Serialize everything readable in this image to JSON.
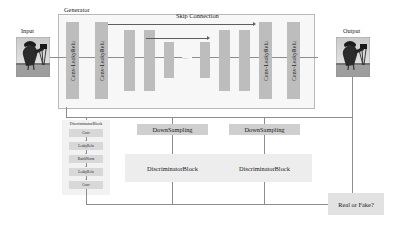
{
  "diagram": {
    "title_generator": "Generator",
    "skip_connection": "Skip Connection",
    "input_label": "Input",
    "output_label": "Output",
    "ellipsis": "...",
    "generator_blocks": [
      {
        "label": "Conv-LeakyRelu"
      },
      {
        "label": "Conv-LeakyRelu"
      },
      {
        "label": "Conv-LeakyRelu"
      },
      {
        "label": "Conv-LeakyRelu"
      }
    ],
    "encoder_bars": 2,
    "bottleneck_bars": 2,
    "decoder_bars": 2,
    "downsampling_label": "DownSampling",
    "discriminator_block_label": "DiscriminatorBlock",
    "downsampling_boxes": [
      "DownSampling",
      "DownSampling"
    ],
    "discriminator_boxes": [
      "DiscriminatorBlock",
      "DiscriminatorBlock"
    ],
    "real_or_fake_label": "Real or Fake?",
    "discriminator_detail": {
      "title": "DiscriminatorBlock",
      "layers": [
        "Conv",
        "LeakyRelu",
        "BatchNorm",
        "LeakyRelu",
        "Conv"
      ]
    },
    "colors": {
      "bar": "#bdbdbd",
      "box": "#e2e2e2",
      "box_soft": "#ededed",
      "box_dark": "#cfcfcf",
      "line": "#8d8d8d",
      "arrow": "#5e5e5e",
      "panel_border": "#b9b9b9",
      "panel_fill": "#f7f7f7",
      "text": "#1a1a1a",
      "background": "#ffffff"
    }
  }
}
